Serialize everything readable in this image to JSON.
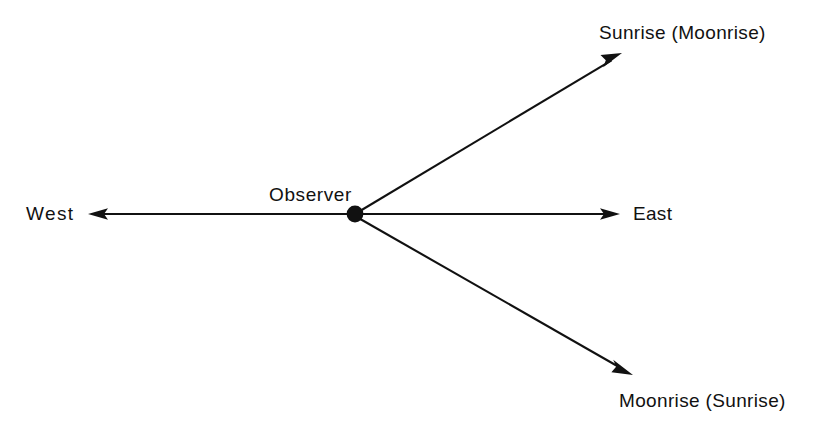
{
  "diagram": {
    "type": "celestial-rising-directions",
    "background_color": "#ffffff",
    "stroke_color": "#111111",
    "center": {
      "label": "Observer",
      "marker": "filled-circle",
      "x": 355,
      "y": 214,
      "radius": 8
    },
    "rays": [
      {
        "id": "west",
        "label": "West",
        "arrowhead": "solid-triangle",
        "direction_degrees": 180,
        "tip_x": 88,
        "tip_y": 214
      },
      {
        "id": "east",
        "label": "East",
        "arrowhead": "solid-triangle",
        "direction_degrees": 0,
        "tip_x": 620,
        "tip_y": 214
      },
      {
        "id": "sunrise-moonrise",
        "label": "Sunrise (Moonrise)",
        "arrowhead": "solid-triangle",
        "direction_degrees": 31,
        "tip_x": 622,
        "tip_y": 53
      },
      {
        "id": "moonrise-sunrise",
        "label": "Moonrise (Sunrise)",
        "arrowhead": "solid-triangle",
        "direction_degrees": -30,
        "tip_x": 633,
        "tip_y": 375
      }
    ]
  }
}
